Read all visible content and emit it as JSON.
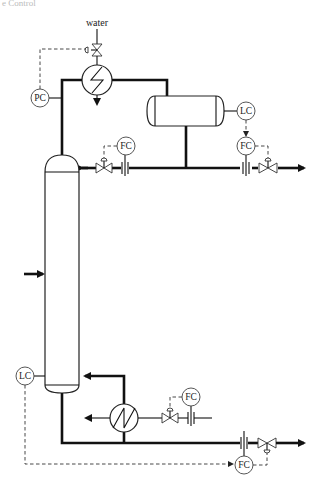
{
  "header": {
    "clipped_title": "e Control"
  },
  "labels": {
    "water": "water"
  },
  "instruments": {
    "pc": "PC",
    "lc_drum": "LC",
    "fc_distillate": "FC",
    "fc_reflux": "FC",
    "fc_steam": "FC",
    "lc_bottom": "LC",
    "fc_bottoms": "FC"
  },
  "equipment": {
    "column": "distillation-column",
    "condenser": "condenser",
    "reflux_drum": "reflux-drum",
    "reboiler": "reboiler"
  },
  "colors": {
    "line": "#111111",
    "signal": "#333333",
    "background": "#ffffff"
  }
}
